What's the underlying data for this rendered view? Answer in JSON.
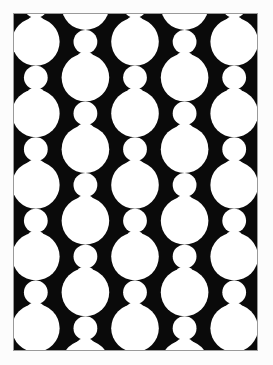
{
  "page": {
    "title": "Black and White Circle Lattice Print",
    "background_color": "#fcfcfc",
    "width": 273,
    "height": 365
  },
  "frame": {
    "x": 13,
    "y": 13,
    "width": 245,
    "height": 338,
    "border_color": "#9a9a9a",
    "border_width": 1
  },
  "artwork": {
    "name": "Op-art circle lattice",
    "ink_color": "#0a0a0a",
    "paper_color": "#ffffff",
    "description": "Vertical chains of tangent white circles alternating large and small on a black ground; adjacent columns are phase-shifted so the black bands are bitten into pinched diamond forms.",
    "geometry": {
      "view_width": 245,
      "view_height": 338,
      "column_count": 5,
      "column_spacing": 50,
      "column_first_center_x": 22,
      "vertical_period": 72,
      "large_radius": 24,
      "small_radius": 12,
      "phase_offset_odd_columns": 36,
      "unit_offsets": [
        {
          "dy": 0,
          "r": 24,
          "size": "large"
        },
        {
          "dy": 36,
          "r": 12,
          "size": "small"
        },
        {
          "dy": 57,
          "r": 11,
          "size": "small"
        }
      ],
      "row_starts": [
        -44,
        28,
        100,
        172,
        244,
        316,
        388
      ],
      "columns": [
        {
          "index": 0,
          "center_x": 22,
          "phase": 0
        },
        {
          "index": 1,
          "center_x": 72,
          "phase": 36
        },
        {
          "index": 2,
          "center_x": 122,
          "phase": 0
        },
        {
          "index": 3,
          "center_x": 172,
          "phase": 36
        },
        {
          "index": 4,
          "center_x": 222,
          "phase": 0
        }
      ]
    }
  }
}
